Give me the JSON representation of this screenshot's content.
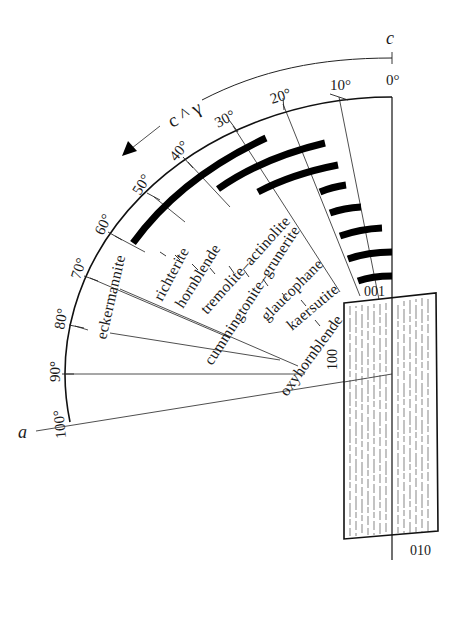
{
  "diagram": {
    "title_symbol": "c ^ γ",
    "axes": {
      "c_label": "c",
      "a_label": "a"
    },
    "angle_scale": {
      "ticks": [
        "0°",
        "10°",
        "20°",
        "30°",
        "40°",
        "50°",
        "60°",
        "70°",
        "80°",
        "90°",
        "100°"
      ],
      "values": [
        0,
        10,
        20,
        30,
        40,
        50,
        60,
        70,
        80,
        90,
        100
      ]
    },
    "minerals": [
      {
        "name": "eckermannite",
        "range_deg": [
          0,
          0
        ]
      },
      {
        "name": "richterite",
        "range_deg": [
          15,
          40
        ]
      },
      {
        "name": "hornblende",
        "range_deg": [
          12,
          34
        ]
      },
      {
        "name": "tremolite–actinolite",
        "range_deg": [
          10,
          21
        ]
      },
      {
        "name": "cummingtonite–grunerite",
        "range_deg": [
          10,
          21
        ]
      },
      {
        "name": "glaucophane",
        "range_deg": [
          4,
          14
        ]
      },
      {
        "name": "kaersutite",
        "range_deg": [
          0,
          19
        ]
      },
      {
        "name": "oxyhornblende",
        "range_deg": [
          0,
          10
        ]
      }
    ],
    "crystal_faces": {
      "face_001": "001",
      "face_100": "100",
      "face_010": "010"
    },
    "colors": {
      "line": "#111111",
      "background": "#ffffff"
    }
  }
}
